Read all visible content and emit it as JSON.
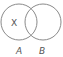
{
  "diagram": {
    "type": "venn",
    "sets": [
      {
        "name": "A",
        "label": "A"
      },
      {
        "name": "B",
        "label": "B"
      }
    ],
    "region_marker": {
      "text": "X",
      "region": "A only"
    },
    "stroke_color": "#8a8a8a",
    "text_color": "#555555"
  }
}
